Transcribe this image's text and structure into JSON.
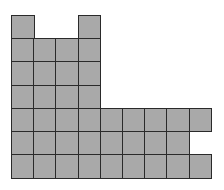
{
  "diagram": {
    "type": "grid-shape",
    "fill_color": "#a9a9a9",
    "line_color": "#2a2a2a",
    "origin": {
      "x": 11,
      "y": 15
    },
    "cell_width": 22.2,
    "cell_height": 23.2,
    "rows": 7,
    "cols": 9,
    "filled_cells": [
      [
        1,
        0,
        0,
        1,
        0,
        0,
        0,
        0,
        0
      ],
      [
        1,
        1,
        1,
        1,
        0,
        0,
        0,
        0,
        0
      ],
      [
        1,
        1,
        1,
        1,
        0,
        0,
        0,
        0,
        0
      ],
      [
        1,
        1,
        1,
        1,
        0,
        0,
        0,
        0,
        0
      ],
      [
        1,
        1,
        1,
        1,
        1,
        1,
        1,
        1,
        1
      ],
      [
        1,
        1,
        1,
        1,
        1,
        1,
        1,
        1,
        0
      ],
      [
        1,
        1,
        1,
        1,
        1,
        1,
        1,
        1,
        1
      ]
    ],
    "total_filled": 40
  }
}
